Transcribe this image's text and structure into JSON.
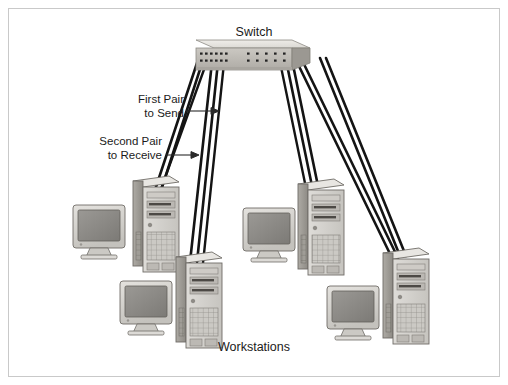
{
  "figure": {
    "kind": "network-diagram",
    "background_color": "#ffffff",
    "border_color": "#c9c9c9"
  },
  "labels": {
    "switch": "Switch",
    "workstations": "Workstations",
    "first_pair": "First Pair\nto Send",
    "second_pair": "Second Pair\nto Receive"
  },
  "switch_device": {
    "name": "Switch",
    "port_rows": 2,
    "ports_per_row": 12,
    "top_face_color": "#e9e7e3",
    "front_face_color": "#bdbab4",
    "side_face_color": "#9f9c96",
    "port_color": "#2b2b2b"
  },
  "cables": {
    "color": "#141414",
    "pair_count": 8,
    "description": "Twisted-pair cables run in pairs from switch ports down to each workstation tower"
  },
  "workstations": [
    {
      "id": "ws-1",
      "monitor_label": "crt-monitor",
      "tower_label": "tower-pc"
    },
    {
      "id": "ws-2",
      "monitor_label": "crt-monitor",
      "tower_label": "tower-pc"
    },
    {
      "id": "ws-3",
      "monitor_label": "crt-monitor",
      "tower_label": "tower-pc"
    },
    {
      "id": "ws-4",
      "monitor_label": "crt-monitor",
      "tower_label": "tower-pc"
    }
  ],
  "colors": {
    "monitor_bezel": "#d8d6d2",
    "monitor_screen": "#8e8c88",
    "tower_front": "#d3d1cd",
    "tower_side": "#a5a29c",
    "tower_top": "#e6e4e0",
    "grille": "#b5b2ac",
    "outline": "#5d5b57"
  }
}
